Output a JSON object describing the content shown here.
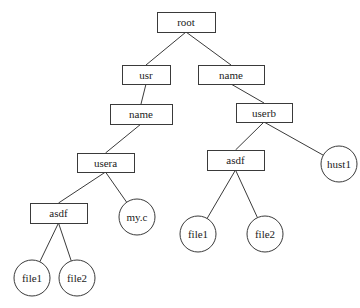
{
  "diagram": {
    "nodes": [
      {
        "id": "root",
        "label": "root",
        "shape": "rect",
        "x": 157,
        "y": 12,
        "w": 58,
        "h": 20
      },
      {
        "id": "usr",
        "label": "usr",
        "shape": "rect",
        "x": 122,
        "y": 65,
        "w": 48,
        "h": 19
      },
      {
        "id": "name_r",
        "label": "name",
        "shape": "rect",
        "x": 198,
        "y": 65,
        "w": 66,
        "h": 19
      },
      {
        "id": "name_l",
        "label": "name",
        "shape": "rect",
        "x": 110,
        "y": 104,
        "w": 62,
        "h": 20
      },
      {
        "id": "userb",
        "label": "userb",
        "shape": "rect",
        "x": 236,
        "y": 103,
        "w": 56,
        "h": 19
      },
      {
        "id": "usera",
        "label": "usera",
        "shape": "rect",
        "x": 77,
        "y": 153,
        "w": 57,
        "h": 19
      },
      {
        "id": "asdf_r",
        "label": "asdf",
        "shape": "rect",
        "x": 207,
        "y": 150,
        "w": 57,
        "h": 20
      },
      {
        "id": "hust1",
        "label": "hust1",
        "shape": "circle",
        "cx": 339,
        "cy": 164,
        "r": 18
      },
      {
        "id": "asdf_l",
        "label": "asdf",
        "shape": "rect",
        "x": 30,
        "y": 203,
        "w": 57,
        "h": 20
      },
      {
        "id": "myc",
        "label": "my.c",
        "shape": "circle",
        "cx": 137,
        "cy": 217,
        "r": 18
      },
      {
        "id": "file1_r",
        "label": "file1",
        "shape": "circle",
        "cx": 198,
        "cy": 234,
        "r": 18
      },
      {
        "id": "file2_r",
        "label": "file2",
        "shape": "circle",
        "cx": 265,
        "cy": 234,
        "r": 18
      },
      {
        "id": "file1_l",
        "label": "file1",
        "shape": "circle",
        "cx": 32,
        "cy": 278,
        "r": 18
      },
      {
        "id": "file2_l",
        "label": "file2",
        "shape": "circle",
        "cx": 77,
        "cy": 278,
        "r": 18
      }
    ],
    "edges": [
      [
        "root",
        "usr"
      ],
      [
        "root",
        "name_r"
      ],
      [
        "usr",
        "name_l"
      ],
      [
        "name_l",
        "usera"
      ],
      [
        "usera",
        "asdf_l"
      ],
      [
        "usera",
        "myc"
      ],
      [
        "asdf_l",
        "file1_l"
      ],
      [
        "asdf_l",
        "file2_l"
      ],
      [
        "name_r",
        "userb"
      ],
      [
        "userb",
        "asdf_r"
      ],
      [
        "userb",
        "hust1"
      ],
      [
        "asdf_r",
        "file1_r"
      ],
      [
        "asdf_r",
        "file2_r"
      ]
    ]
  }
}
